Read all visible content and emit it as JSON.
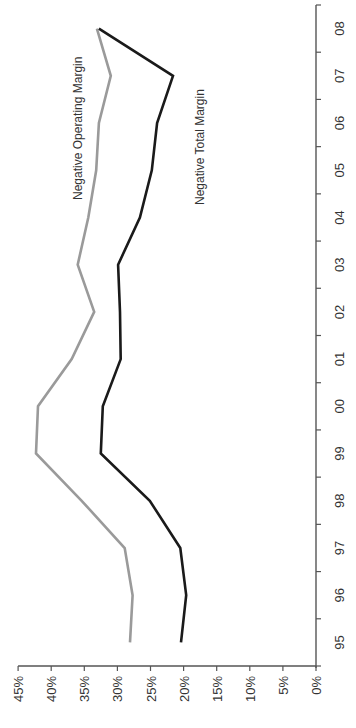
{
  "chart_data": {
    "type": "line",
    "orientation": "rotated-90-ccw",
    "title": "",
    "xlabel": "",
    "ylabel": "",
    "categories": [
      "95",
      "96",
      "97",
      "98",
      "99",
      "00",
      "01",
      "02",
      "03",
      "04",
      "05",
      "06",
      "07",
      "08"
    ],
    "ylim": [
      0,
      45
    ],
    "yticks": [
      "0%",
      "5%",
      "10%",
      "15%",
      "20%",
      "25%",
      "30%",
      "35%",
      "40%",
      "45%"
    ],
    "grid": false,
    "legend": "inline labels",
    "series": [
      {
        "name": "Negative Operating Margin",
        "color": "#9a9a9a",
        "values": [
          28.1,
          27.7,
          28.9,
          35.4,
          42.3,
          42.0,
          36.9,
          33.5,
          36.0,
          34.4,
          33.2,
          32.8,
          31.0,
          33.1
        ]
      },
      {
        "name": "Negative Total Margin",
        "color": "#1a1a1a",
        "values": [
          20.4,
          19.6,
          20.5,
          25.1,
          32.5,
          32.2,
          29.5,
          29.6,
          29.9,
          26.6,
          24.8,
          24.0,
          21.6,
          32.8
        ]
      }
    ]
  },
  "labels": {
    "operating": "Negative Operating Margin",
    "total": "Negative Total Margin"
  }
}
